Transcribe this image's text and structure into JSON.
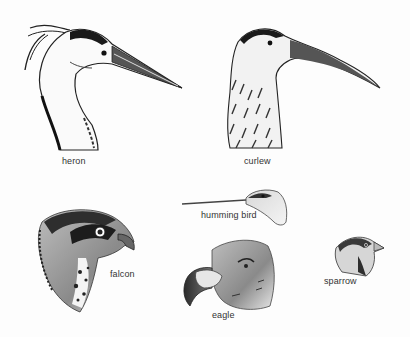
{
  "figure": {
    "birds": [
      {
        "id": "heron",
        "label": "heron"
      },
      {
        "id": "curlew",
        "label": "curlew"
      },
      {
        "id": "humming-bird",
        "label": "humming bird"
      },
      {
        "id": "falcon",
        "label": "falcon"
      },
      {
        "id": "sparrow",
        "label": "sparrow"
      },
      {
        "id": "eagle",
        "label": "eagle"
      }
    ]
  }
}
